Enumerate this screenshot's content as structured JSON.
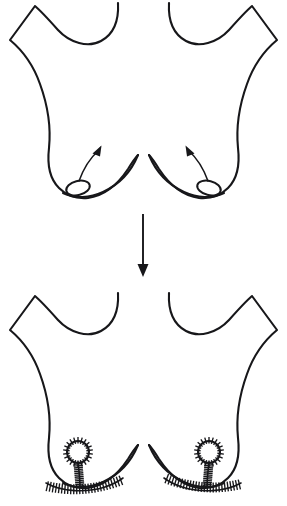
{
  "figure": {
    "caption": "",
    "type": "medical-surgical-illustration",
    "background_color": "#ffffff",
    "line_color": "#17171a",
    "canvas": {
      "width": 287,
      "height": 506
    }
  },
  "panels": [
    {
      "id": "preoperative",
      "label": "Preoperative ptotic breasts",
      "order": 1,
      "torso": {
        "label": "female-torso-outline",
        "top_y": 4,
        "bottom_y": 200,
        "shoulder_peak_left": {
          "x": 35,
          "y": 6
        },
        "shoulder_peak_right": {
          "x": 252,
          "y": 6
        },
        "axilla_point_left": {
          "x": 10,
          "y": 40
        },
        "axilla_point_right": {
          "x": 277,
          "y": 40
        },
        "neck_line_left_top": {
          "x": 118,
          "y": 3
        },
        "neck_line_right_top": {
          "x": 175,
          "y": 3
        }
      },
      "breasts": [
        {
          "side": "left",
          "label": "left-breast-ptotic",
          "nipple": {
            "label": "left-nipple-areola-low",
            "shape": "ellipse",
            "cx": 78,
            "cy": 188,
            "rx": 12,
            "ry": 7,
            "rotation_deg": -14
          },
          "arrow": {
            "label": "left-nipple-elevation-arrow",
            "direction": "up-right",
            "from": {
              "x": 79,
              "y": 180
            },
            "to": {
              "x": 100,
              "y": 148
            }
          }
        },
        {
          "side": "right",
          "label": "right-breast-ptotic",
          "nipple": {
            "label": "right-nipple-areola-low",
            "shape": "ellipse",
            "cx": 209,
            "cy": 188,
            "rx": 12,
            "ry": 7,
            "rotation_deg": 14
          },
          "arrow": {
            "label": "right-nipple-elevation-arrow",
            "direction": "up-left",
            "from": {
              "x": 208,
              "y": 180
            },
            "to": {
              "x": 187,
              "y": 148
            }
          }
        }
      ]
    },
    {
      "id": "postoperative",
      "label": "Postoperative result with inverted-T sutures",
      "order": 2,
      "torso": {
        "label": "female-torso-outline",
        "top_y": 294,
        "bottom_y": 500,
        "shoulder_peak_left": {
          "x": 35,
          "y": 296
        },
        "shoulder_peak_right": {
          "x": 252,
          "y": 296
        },
        "axilla_point_left": {
          "x": 10,
          "y": 330
        },
        "axilla_point_right": {
          "x": 277,
          "y": 330
        },
        "neck_line_left_top": {
          "x": 118,
          "y": 293
        },
        "neck_line_right_top": {
          "x": 175,
          "y": 293
        }
      },
      "breasts": [
        {
          "side": "left",
          "label": "left-breast-lifted",
          "areola": {
            "label": "left-areola-sutured",
            "shape": "circle",
            "cx": 78,
            "cy": 452,
            "r": 11,
            "suture_count": 22
          },
          "vertical_scar": {
            "label": "left-vertical-scar",
            "from": {
              "x": 78,
              "y": 463
            },
            "to": {
              "x": 80,
              "y": 487
            },
            "suture_count": 13
          },
          "inframammary_scar": {
            "label": "left-inframammary-scar",
            "from": {
              "x": 46,
              "y": 485
            },
            "to": {
              "x": 122,
              "y": 479
            },
            "suture_count": 26
          }
        },
        {
          "side": "right",
          "label": "right-breast-lifted",
          "areola": {
            "label": "right-areola-sutured",
            "shape": "circle",
            "cx": 209,
            "cy": 452,
            "r": 11,
            "suture_count": 22
          },
          "vertical_scar": {
            "label": "right-vertical-scar",
            "from": {
              "x": 209,
              "y": 463
            },
            "to": {
              "x": 207,
              "y": 487
            },
            "suture_count": 13
          },
          "inframammary_scar": {
            "label": "right-inframammary-scar",
            "from": {
              "x": 241,
              "y": 485
            },
            "to": {
              "x": 165,
              "y": 479
            },
            "suture_count": 26
          }
        }
      ]
    }
  ],
  "transition_arrow": {
    "label": "downward-progression-arrow",
    "direction": "down",
    "x": 143,
    "from_y": 214,
    "to_y": 276,
    "head_width": 11,
    "head_length": 12
  }
}
